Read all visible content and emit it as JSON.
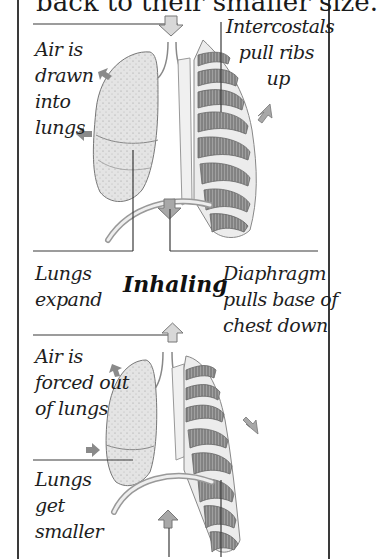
{
  "top_caption": "back to their smaller size.",
  "inhaling": {
    "heading": "Inhaling",
    "labels": {
      "air_drawn": [
        "Air is",
        "drawn",
        "into",
        "lungs"
      ],
      "intercostals": [
        "Intercostals",
        "pull ribs",
        "up"
      ],
      "lungs_expand": [
        "Lungs",
        "expand"
      ],
      "diaphragm": [
        "Diaphragm",
        "pulls base of",
        "chest down"
      ]
    }
  },
  "exhaling": {
    "labels": {
      "air_forced": [
        "Air is",
        "forced out",
        "of lungs"
      ],
      "lungs_smaller": [
        "Lungs",
        "get",
        "smaller"
      ]
    }
  },
  "colors": {
    "border": "#3a3a3a",
    "text": "#1e1e1e",
    "arrow_fill": "#a8a8a8",
    "lung_fill": "#dcdcdc",
    "rib_fill": "#8c8c8c"
  }
}
